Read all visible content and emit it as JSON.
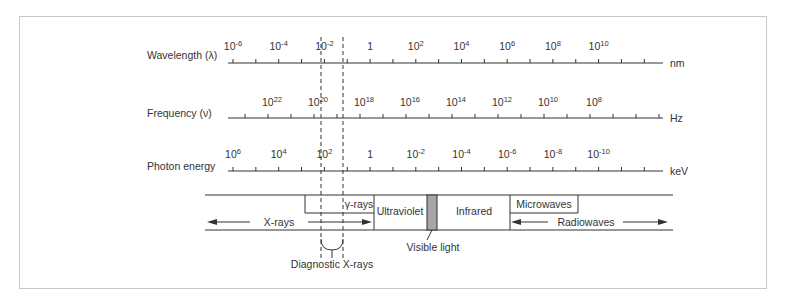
{
  "diagram": {
    "scales": [
      {
        "name": "wavelength",
        "label": "Wavelength (λ)",
        "unit": "nm",
        "ticks": [
          {
            "base": "10",
            "exp": "-6"
          },
          {
            "base": "10",
            "exp": "-4"
          },
          {
            "base": "10",
            "exp": "-2"
          },
          {
            "base": "1",
            "exp": ""
          },
          {
            "base": "10",
            "exp": "2"
          },
          {
            "base": "10",
            "exp": "4"
          },
          {
            "base": "10",
            "exp": "6"
          },
          {
            "base": "10",
            "exp": "8"
          },
          {
            "base": "10",
            "exp": "10"
          }
        ]
      },
      {
        "name": "frequency",
        "label": "Frequency (ν)",
        "unit": "Hz",
        "ticks": [
          {
            "base": "10",
            "exp": "22"
          },
          {
            "base": "10",
            "exp": "20"
          },
          {
            "base": "10",
            "exp": "18"
          },
          {
            "base": "10",
            "exp": "16"
          },
          {
            "base": "10",
            "exp": "14"
          },
          {
            "base": "10",
            "exp": "12"
          },
          {
            "base": "10",
            "exp": "10"
          },
          {
            "base": "10",
            "exp": "8"
          }
        ]
      },
      {
        "name": "photon-energy",
        "label": "Photon energy",
        "unit": "keV",
        "ticks": [
          {
            "base": "10",
            "exp": "6"
          },
          {
            "base": "10",
            "exp": "4"
          },
          {
            "base": "10",
            "exp": "2"
          },
          {
            "base": "1",
            "exp": ""
          },
          {
            "base": "10",
            "exp": "-2"
          },
          {
            "base": "10",
            "exp": "-4"
          },
          {
            "base": "10",
            "exp": "-6"
          },
          {
            "base": "10",
            "exp": "-8"
          },
          {
            "base": "10",
            "exp": "-10"
          }
        ]
      }
    ],
    "bands": {
      "xrays": "X-rays",
      "gamma": "γ-rays",
      "ultraviolet": "Ultraviolet",
      "infrared": "Infrared",
      "microwaves": "Microwaves",
      "radiowaves": "Radiowaves"
    },
    "annotations": {
      "visible_light": "Visible light",
      "diagnostic_xrays": "Diagnostic X-rays"
    },
    "colors": {
      "line": "#333333",
      "frame": "#c8c8c8",
      "visible_band": "#a6a6a6"
    }
  }
}
